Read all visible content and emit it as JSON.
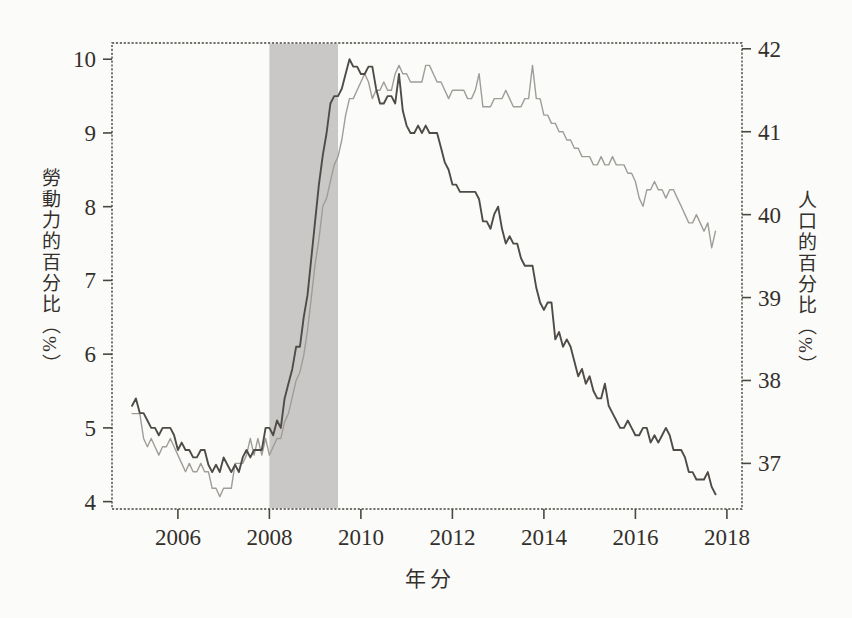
{
  "figure": {
    "background": "#fbfbf9",
    "frame_color": "#4a4740",
    "text_color": "#33302b"
  },
  "chart_data": {
    "type": "line",
    "title": "",
    "xlabel": "年分",
    "ylabel_left": "勞動力的百分比（%）",
    "ylabel_right": "人口的百分比（%）",
    "x_ticks": [
      2006,
      2008,
      2010,
      2012,
      2014,
      2016,
      2018
    ],
    "left_ticks": [
      4,
      5,
      6,
      7,
      8,
      9,
      10
    ],
    "right_ticks": [
      37,
      38,
      39,
      40,
      41,
      42
    ],
    "x_range": [
      2004.56,
      2018.33
    ],
    "left_range": [
      3.9,
      10.22
    ],
    "right_range": [
      36.45,
      42.07
    ],
    "grid": false,
    "legend": "none",
    "recession_band": {
      "x_start": 2008.0,
      "x_end": 2009.5,
      "color": "#c9c8c6"
    },
    "x_start_year": 2005.0,
    "samples_per_year": 12,
    "series": [
      {
        "name": "人口的百分比（右軸）",
        "axis": "right",
        "color": "#a09d99",
        "width": 1.4,
        "values": [
          37.6,
          37.6,
          37.6,
          37.3,
          37.2,
          37.3,
          37.2,
          37.1,
          37.2,
          37.2,
          37.3,
          37.2,
          37.1,
          37.0,
          36.9,
          37.0,
          36.9,
          36.9,
          37.0,
          36.9,
          36.9,
          36.7,
          36.7,
          36.6,
          36.7,
          36.7,
          36.7,
          37.0,
          37.0,
          37.0,
          37.1,
          37.3,
          37.1,
          37.3,
          37.1,
          37.3,
          37.1,
          37.2,
          37.3,
          37.3,
          37.5,
          37.6,
          37.8,
          38.0,
          38.1,
          38.3,
          38.6,
          39.0,
          39.4,
          39.7,
          40.1,
          40.2,
          40.4,
          40.6,
          40.7,
          40.9,
          41.2,
          41.4,
          41.4,
          41.5,
          41.6,
          41.7,
          41.6,
          41.4,
          41.5,
          41.5,
          41.6,
          41.5,
          41.5,
          41.7,
          41.8,
          41.7,
          41.7,
          41.6,
          41.6,
          41.6,
          41.6,
          41.8,
          41.8,
          41.7,
          41.6,
          41.6,
          41.5,
          41.4,
          41.5,
          41.5,
          41.5,
          41.5,
          41.4,
          41.4,
          41.5,
          41.7,
          41.3,
          41.3,
          41.3,
          41.4,
          41.4,
          41.4,
          41.5,
          41.4,
          41.3,
          41.3,
          41.3,
          41.4,
          41.4,
          41.8,
          41.4,
          41.4,
          41.2,
          41.2,
          41.1,
          41.1,
          41.0,
          41.0,
          40.9,
          40.9,
          40.8,
          40.8,
          40.7,
          40.7,
          40.7,
          40.6,
          40.6,
          40.7,
          40.6,
          40.6,
          40.7,
          40.6,
          40.6,
          40.6,
          40.5,
          40.5,
          40.4,
          40.2,
          40.1,
          40.3,
          40.3,
          40.4,
          40.3,
          40.3,
          40.2,
          40.3,
          40.3,
          40.2,
          40.1,
          40.0,
          39.9,
          39.9,
          40.0,
          39.9,
          39.8,
          39.9,
          39.6,
          39.8
        ]
      },
      {
        "name": "勞動力的百分比（左軸）",
        "axis": "left",
        "color": "#4f4c48",
        "width": 1.9,
        "values": [
          5.3,
          5.4,
          5.2,
          5.2,
          5.1,
          5.0,
          5.0,
          4.9,
          5.0,
          5.0,
          5.0,
          4.9,
          4.7,
          4.8,
          4.7,
          4.7,
          4.6,
          4.6,
          4.7,
          4.7,
          4.5,
          4.4,
          4.5,
          4.4,
          4.6,
          4.5,
          4.4,
          4.5,
          4.4,
          4.6,
          4.7,
          4.6,
          4.7,
          4.7,
          4.7,
          5.0,
          5.0,
          4.9,
          5.1,
          5.0,
          5.4,
          5.6,
          5.8,
          6.1,
          6.1,
          6.5,
          6.8,
          7.3,
          7.8,
          8.3,
          8.7,
          9.0,
          9.4,
          9.5,
          9.5,
          9.6,
          9.8,
          10.0,
          9.9,
          9.9,
          9.8,
          9.8,
          9.9,
          9.9,
          9.6,
          9.4,
          9.4,
          9.5,
          9.5,
          9.4,
          9.8,
          9.3,
          9.1,
          9.0,
          9.0,
          9.1,
          9.0,
          9.1,
          9.0,
          9.0,
          9.0,
          8.8,
          8.6,
          8.5,
          8.3,
          8.3,
          8.2,
          8.2,
          8.2,
          8.2,
          8.2,
          8.1,
          7.8,
          7.8,
          7.7,
          7.9,
          8.0,
          7.7,
          7.5,
          7.6,
          7.5,
          7.5,
          7.3,
          7.2,
          7.2,
          7.2,
          6.9,
          6.7,
          6.6,
          6.7,
          6.7,
          6.2,
          6.3,
          6.1,
          6.2,
          6.1,
          5.9,
          5.7,
          5.8,
          5.6,
          5.7,
          5.5,
          5.4,
          5.4,
          5.6,
          5.3,
          5.2,
          5.1,
          5.0,
          5.0,
          5.1,
          5.0,
          4.9,
          4.9,
          5.0,
          5.0,
          4.8,
          4.9,
          4.8,
          4.9,
          5.0,
          4.9,
          4.7,
          4.7,
          4.7,
          4.6,
          4.4,
          4.4,
          4.3,
          4.3,
          4.3,
          4.4,
          4.2,
          4.1
        ]
      }
    ]
  }
}
